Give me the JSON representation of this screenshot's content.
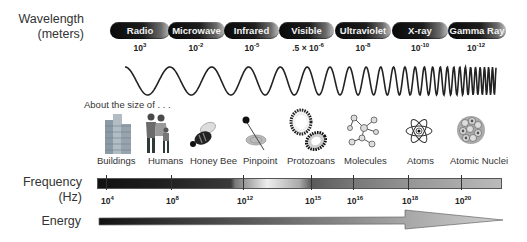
{
  "labels": {
    "wavelength_line1": "Wavelength",
    "wavelength_line2": "(meters)",
    "frequency_line1": "Frequency",
    "frequency_line2": "(Hz)",
    "energy": "Energy",
    "size_of": "About the size of . . ."
  },
  "bands": [
    {
      "name": "Radio",
      "wavelength_base": "10",
      "wavelength_exp": "3"
    },
    {
      "name": "Microwave",
      "wavelength_base": "10",
      "wavelength_exp": "-2"
    },
    {
      "name": "Infrared",
      "wavelength_base": "10",
      "wavelength_exp": "-5"
    },
    {
      "name": "Visible",
      "wavelength_base": ".5 × 10",
      "wavelength_exp": "-6"
    },
    {
      "name": "Ultraviolet",
      "wavelength_base": "10",
      "wavelength_exp": "-8"
    },
    {
      "name": "X-ray",
      "wavelength_base": "10",
      "wavelength_exp": "-10"
    },
    {
      "name": "Gamma Ray",
      "wavelength_base": "10",
      "wavelength_exp": "-12"
    }
  ],
  "size_objects": [
    {
      "label": "Buildings",
      "icon": "building-icon"
    },
    {
      "label": "Humans",
      "icon": "humans-icon"
    },
    {
      "label": "Honey Bee",
      "icon": "bee-icon"
    },
    {
      "label": "Pinpoint",
      "icon": "pin-icon"
    },
    {
      "label": "Protozoans",
      "icon": "protozoan-icon"
    },
    {
      "label": "Molecules",
      "icon": "molecule-icon"
    },
    {
      "label": "Atoms",
      "icon": "atom-icon"
    },
    {
      "label": "Atomic Nuclei",
      "icon": "nucleus-icon"
    }
  ],
  "frequency_ticks": [
    {
      "base": "10",
      "exp": "4"
    },
    {
      "base": "10",
      "exp": "8"
    },
    {
      "base": "10",
      "exp": "12"
    },
    {
      "base": "10",
      "exp": "15"
    },
    {
      "base": "10",
      "exp": "16"
    },
    {
      "base": "10",
      "exp": "18"
    },
    {
      "base": "10",
      "exp": "20"
    }
  ],
  "colors": {
    "pill_dark": "#0a0a0a",
    "pill_light": "#bdbdbd",
    "wave": "#222222",
    "arrow_start": "#111111",
    "arrow_end": "#c8c8c8"
  }
}
